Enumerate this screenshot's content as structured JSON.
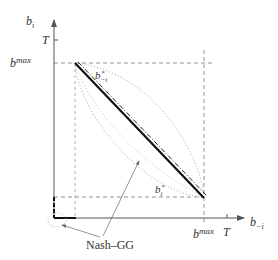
{
  "diagram": {
    "axes": {
      "y_label": "b",
      "y_label_sub": "i",
      "x_label": "b",
      "x_label_sub": "−i",
      "y_tick_T": "T",
      "x_tick_T": "T",
      "y_tick_bmax_base": "b",
      "y_tick_bmax_sup": "max",
      "x_tick_bmax_base": "b",
      "x_tick_bmax_sup": "max"
    },
    "curves": {
      "upper_label_base": "b",
      "upper_label_sup": "*",
      "upper_label_sub": "−i",
      "lower_label_base": "b",
      "lower_label_sup": "*",
      "lower_label_sub": "i"
    },
    "annotation": {
      "nash_label": "Nash–GG"
    },
    "colors": {
      "axis": "#555555",
      "dashed": "#777777",
      "dotted": "#aaaaaa",
      "main_line": "#111111"
    }
  }
}
